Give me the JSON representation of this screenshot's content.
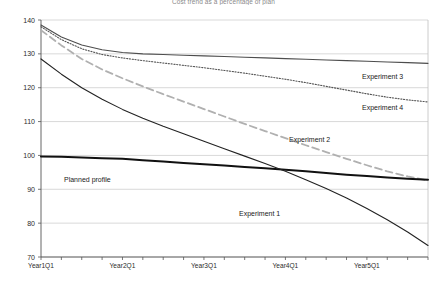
{
  "chart_data": {
    "type": "line",
    "title": "Cost trend as a percentage of plan",
    "xlabel": "",
    "ylabel": "",
    "ylim": [
      70,
      140
    ],
    "yticks": [
      70,
      80,
      90,
      100,
      110,
      120,
      130,
      140
    ],
    "grid": true,
    "legend_position": "inline-annotations",
    "categories": [
      "Year1Q1",
      "Year1Q2",
      "Year1Q3",
      "Year1Q4",
      "Year2Q1",
      "Year2Q2",
      "Year2Q3",
      "Year2Q4",
      "Year3Q1",
      "Year3Q2",
      "Year3Q3",
      "Year3Q4",
      "Year4Q1",
      "Year4Q2",
      "Year4Q3",
      "Year4Q4",
      "Year5Q1",
      "Year5Q2",
      "Year5Q3",
      "Year5Q4"
    ],
    "xtick_labels": [
      "Year1Q1",
      "Year2Q1",
      "Year3Q1",
      "Year4Q1",
      "Year5Q1"
    ],
    "series": [
      {
        "name": "Experiment 3",
        "style": "solid",
        "color": "#4d4d4d",
        "width": 1.1,
        "label_x": 362,
        "label_y": 73,
        "values": [
          138.5,
          135.0,
          132.6,
          131.2,
          130.4,
          130.0,
          129.8,
          129.6,
          129.4,
          129.2,
          129.0,
          128.8,
          128.6,
          128.4,
          128.2,
          128.0,
          127.8,
          127.6,
          127.4,
          127.2
        ]
      },
      {
        "name": "Experiment 4",
        "style": "dotted",
        "color": "#555555",
        "width": 1.1,
        "label_x": 362,
        "label_y": 104,
        "values": [
          138.0,
          134.2,
          131.5,
          129.8,
          128.8,
          128.0,
          127.3,
          126.6,
          125.9,
          125.1,
          124.3,
          123.4,
          122.5,
          121.5,
          120.4,
          119.3,
          118.2,
          117.2,
          116.4,
          115.8
        ]
      },
      {
        "name": "Experiment 2",
        "style": "dashed",
        "color": "#b0b0b0",
        "width": 1.8,
        "label_x": 289,
        "label_y": 136,
        "values": [
          137.0,
          132.5,
          128.5,
          125.4,
          122.8,
          120.4,
          118.1,
          115.9,
          113.7,
          111.5,
          109.3,
          107.2,
          105.1,
          103.0,
          101.0,
          99.0,
          97.1,
          95.3,
          93.8,
          92.6
        ]
      },
      {
        "name": "Planned profile",
        "style": "solid",
        "color": "#111111",
        "width": 2.0,
        "label_x": 64,
        "label_y": 176,
        "values": [
          99.7,
          99.6,
          99.4,
          99.2,
          99.0,
          98.6,
          98.2,
          97.8,
          97.4,
          97.0,
          96.6,
          96.2,
          95.8,
          95.3,
          94.8,
          94.3,
          93.9,
          93.5,
          93.1,
          92.8
        ]
      },
      {
        "name": "Experiment 1",
        "style": "solid",
        "color": "#222222",
        "width": 1.1,
        "label_x": 239,
        "label_y": 210,
        "values": [
          128.5,
          124.0,
          120.0,
          116.6,
          113.6,
          111.0,
          108.6,
          106.4,
          104.2,
          102.0,
          99.8,
          97.6,
          95.3,
          92.8,
          90.2,
          87.4,
          84.3,
          81.0,
          77.4,
          73.4
        ]
      }
    ]
  },
  "axes": {
    "plot_left": 41,
    "plot_right": 428,
    "plot_top": 20,
    "plot_bottom": 257
  }
}
